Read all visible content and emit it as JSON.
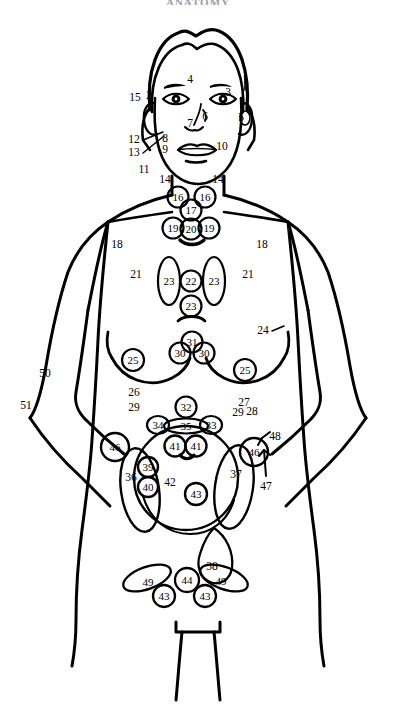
{
  "heading": "ANATOMY",
  "figure": {
    "view": "anterior",
    "stroke_color": "#000000",
    "background_color": "#ffffff"
  },
  "chart_data": {
    "type": "diagram",
    "legend_position": "none",
    "grid": false,
    "labels": [
      {
        "id": "label-1",
        "text": "1",
        "x": 245,
        "y": 80,
        "kind": "plain",
        "region": "head"
      },
      {
        "id": "label-2",
        "text": "2",
        "x": 149,
        "y": 96,
        "kind": "plain",
        "region": "head"
      },
      {
        "id": "label-3",
        "text": "3",
        "x": 228,
        "y": 93,
        "kind": "plain",
        "region": "head"
      },
      {
        "id": "label-4",
        "text": "4",
        "x": 190,
        "y": 80,
        "kind": "plain",
        "region": "head"
      },
      {
        "id": "label-5",
        "text": "5",
        "x": 241,
        "y": 118,
        "kind": "plain",
        "region": "head"
      },
      {
        "id": "label-6",
        "text": "6",
        "x": 205,
        "y": 117,
        "kind": "plain",
        "region": "head"
      },
      {
        "id": "label-7",
        "text": "7",
        "x": 190,
        "y": 124,
        "kind": "plain",
        "region": "head"
      },
      {
        "id": "label-8",
        "text": "8",
        "x": 165,
        "y": 139,
        "kind": "plain",
        "region": "head"
      },
      {
        "id": "label-9",
        "text": "9",
        "x": 165,
        "y": 150,
        "kind": "plain",
        "region": "head"
      },
      {
        "id": "label-10",
        "text": "10",
        "x": 222,
        "y": 147,
        "kind": "plain",
        "region": "head"
      },
      {
        "id": "label-11",
        "text": "11",
        "x": 144,
        "y": 170,
        "kind": "plain",
        "region": "neck"
      },
      {
        "id": "label-12",
        "text": "12",
        "x": 134,
        "y": 140,
        "kind": "plain",
        "region": "neck"
      },
      {
        "id": "label-13",
        "text": "13",
        "x": 134,
        "y": 153,
        "kind": "plain",
        "region": "neck"
      },
      {
        "id": "label-14",
        "text": "14",
        "x": 165,
        "y": 180,
        "kind": "plain",
        "region": "neck"
      },
      {
        "id": "label-14b",
        "text": "14",
        "x": 218,
        "y": 180,
        "kind": "plain",
        "region": "neck"
      },
      {
        "id": "label-15",
        "text": "15",
        "x": 135,
        "y": 98,
        "kind": "plain",
        "region": "head"
      },
      {
        "id": "label-16",
        "text": "16",
        "x": 178,
        "y": 197,
        "kind": "organ",
        "region": "neck"
      },
      {
        "id": "label-16b",
        "text": "16",
        "x": 205,
        "y": 197,
        "kind": "organ",
        "region": "neck"
      },
      {
        "id": "label-17",
        "text": "17",
        "x": 191,
        "y": 210,
        "kind": "organ",
        "region": "neck"
      },
      {
        "id": "label-18",
        "text": "18",
        "x": 117,
        "y": 245,
        "kind": "plain",
        "region": "chest"
      },
      {
        "id": "label-18b",
        "text": "18",
        "x": 262,
        "y": 245,
        "kind": "plain",
        "region": "chest"
      },
      {
        "id": "label-19",
        "text": "19",
        "x": 173,
        "y": 228,
        "kind": "organ",
        "region": "neck"
      },
      {
        "id": "label-19b",
        "text": "19",
        "x": 209,
        "y": 228,
        "kind": "organ",
        "region": "neck"
      },
      {
        "id": "label-20",
        "text": "20",
        "x": 191,
        "y": 229,
        "kind": "organ",
        "region": "neck"
      },
      {
        "id": "label-21",
        "text": "21",
        "x": 136,
        "y": 275,
        "kind": "plain",
        "region": "chest"
      },
      {
        "id": "label-21b",
        "text": "21",
        "x": 248,
        "y": 275,
        "kind": "plain",
        "region": "chest"
      },
      {
        "id": "label-22",
        "text": "22",
        "x": 191,
        "y": 281,
        "kind": "organ",
        "region": "chest"
      },
      {
        "id": "label-23",
        "text": "23",
        "x": 169,
        "y": 281,
        "kind": "organ",
        "region": "chest"
      },
      {
        "id": "label-23b",
        "text": "23",
        "x": 214,
        "y": 281,
        "kind": "organ",
        "region": "chest"
      },
      {
        "id": "label-23c",
        "text": "23",
        "x": 191,
        "y": 306,
        "kind": "organ",
        "region": "chest"
      },
      {
        "id": "label-24",
        "text": "24",
        "x": 263,
        "y": 331,
        "kind": "plain",
        "region": "chest"
      },
      {
        "id": "label-25",
        "text": "25",
        "x": 133,
        "y": 360,
        "kind": "organ",
        "region": "breast"
      },
      {
        "id": "label-25b",
        "text": "25",
        "x": 245,
        "y": 370,
        "kind": "organ",
        "region": "breast"
      },
      {
        "id": "label-26",
        "text": "26",
        "x": 134,
        "y": 393,
        "kind": "plain",
        "region": "abdomen"
      },
      {
        "id": "label-27",
        "text": "27",
        "x": 244,
        "y": 403,
        "kind": "plain",
        "region": "abdomen"
      },
      {
        "id": "label-28",
        "text": "28",
        "x": 252,
        "y": 412,
        "kind": "plain",
        "region": "abdomen"
      },
      {
        "id": "label-29",
        "text": "29",
        "x": 134,
        "y": 408,
        "kind": "plain",
        "region": "abdomen"
      },
      {
        "id": "label-29b",
        "text": "29",
        "x": 238,
        "y": 413,
        "kind": "plain",
        "region": "abdomen"
      },
      {
        "id": "label-30",
        "text": "30",
        "x": 180,
        "y": 353,
        "kind": "organ",
        "region": "chest"
      },
      {
        "id": "label-30b",
        "text": "30",
        "x": 204,
        "y": 353,
        "kind": "organ",
        "region": "chest"
      },
      {
        "id": "label-31",
        "text": "31",
        "x": 192,
        "y": 342,
        "kind": "organ",
        "region": "chest"
      },
      {
        "id": "label-32",
        "text": "32",
        "x": 186,
        "y": 407,
        "kind": "organ",
        "region": "abdomen"
      },
      {
        "id": "label-33",
        "text": "33",
        "x": 211,
        "y": 425,
        "kind": "organ",
        "region": "abdomen"
      },
      {
        "id": "label-34",
        "text": "34",
        "x": 158,
        "y": 425,
        "kind": "organ",
        "region": "abdomen"
      },
      {
        "id": "label-35",
        "text": "35",
        "x": 186,
        "y": 426,
        "kind": "organ",
        "region": "abdomen"
      },
      {
        "id": "label-36",
        "text": "36",
        "x": 131,
        "y": 478,
        "kind": "plain",
        "region": "pelvis"
      },
      {
        "id": "label-37",
        "text": "37",
        "x": 236,
        "y": 475,
        "kind": "plain",
        "region": "pelvis"
      },
      {
        "id": "label-38",
        "text": "38",
        "x": 212,
        "y": 567,
        "kind": "plain",
        "region": "pelvis"
      },
      {
        "id": "label-39",
        "text": "39",
        "x": 148,
        "y": 467,
        "kind": "organ",
        "region": "pelvis"
      },
      {
        "id": "label-40",
        "text": "40",
        "x": 148,
        "y": 487,
        "kind": "organ",
        "region": "pelvis"
      },
      {
        "id": "label-41",
        "text": "41",
        "x": 175,
        "y": 446,
        "kind": "organ",
        "region": "pelvis"
      },
      {
        "id": "label-41b",
        "text": "41",
        "x": 196,
        "y": 446,
        "kind": "organ",
        "region": "pelvis"
      },
      {
        "id": "label-42",
        "text": "42",
        "x": 170,
        "y": 483,
        "kind": "plain",
        "region": "pelvis"
      },
      {
        "id": "label-43",
        "text": "43",
        "x": 196,
        "y": 494,
        "kind": "organ",
        "region": "pelvis"
      },
      {
        "id": "label-43b",
        "text": "43",
        "x": 164,
        "y": 596,
        "kind": "organ",
        "region": "pelvis"
      },
      {
        "id": "label-43c",
        "text": "43",
        "x": 205,
        "y": 596,
        "kind": "organ",
        "region": "pelvis"
      },
      {
        "id": "label-44",
        "text": "44",
        "x": 187,
        "y": 580,
        "kind": "organ",
        "region": "pelvis"
      },
      {
        "id": "label-46",
        "text": "46",
        "x": 115,
        "y": 447,
        "kind": "organ",
        "region": "pelvis"
      },
      {
        "id": "label-46b",
        "text": "46",
        "x": 254,
        "y": 452,
        "kind": "organ",
        "region": "pelvis"
      },
      {
        "id": "label-47",
        "text": "47",
        "x": 266,
        "y": 487,
        "kind": "plain",
        "region": "pelvis"
      },
      {
        "id": "label-48",
        "text": "48",
        "x": 275,
        "y": 437,
        "kind": "plain",
        "region": "pelvis"
      },
      {
        "id": "label-49",
        "text": "49",
        "x": 148,
        "y": 582,
        "kind": "organ",
        "region": "pelvis"
      },
      {
        "id": "label-49b",
        "text": "49",
        "x": 221,
        "y": 581,
        "kind": "organ",
        "region": "pelvis"
      },
      {
        "id": "label-50",
        "text": "50",
        "x": 45,
        "y": 374,
        "kind": "plain",
        "region": "arm"
      },
      {
        "id": "label-51",
        "text": "51",
        "x": 26,
        "y": 406,
        "kind": "plain",
        "region": "arm"
      }
    ]
  }
}
